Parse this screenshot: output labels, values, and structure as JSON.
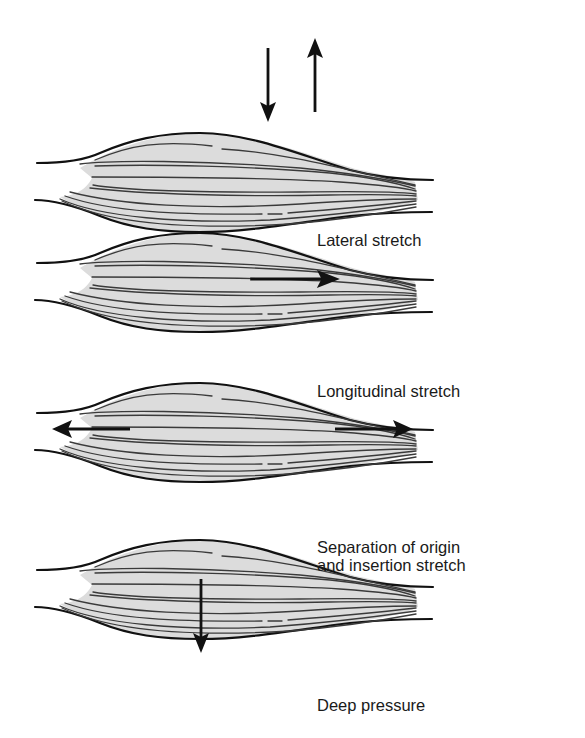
{
  "figure": {
    "type": "muscle-stretch-techniques",
    "colors": {
      "muscle_fill": "#dcdcdc",
      "outline": "#111111",
      "fiber": "#3a3a3a",
      "arrow": "#111111",
      "label": "#1a1a1a",
      "background": "#ffffff"
    },
    "panels": [
      {
        "label": "Lateral stretch",
        "arrows": [
          {
            "direction": "down",
            "icon": "arrow-down-icon"
          },
          {
            "direction": "up",
            "icon": "arrow-up-icon"
          }
        ]
      },
      {
        "label": "Longitudinal stretch",
        "arrows": [
          {
            "direction": "right",
            "icon": "arrow-right-icon"
          }
        ]
      },
      {
        "label_line1": "Separation of origin",
        "label_line2": "and insertion stretch",
        "arrows": [
          {
            "direction": "left",
            "icon": "arrow-left-icon"
          },
          {
            "direction": "right",
            "icon": "arrow-right-icon"
          }
        ]
      },
      {
        "label": "Deep pressure",
        "arrows": [
          {
            "direction": "down",
            "icon": "arrow-down-icon"
          }
        ]
      }
    ]
  }
}
